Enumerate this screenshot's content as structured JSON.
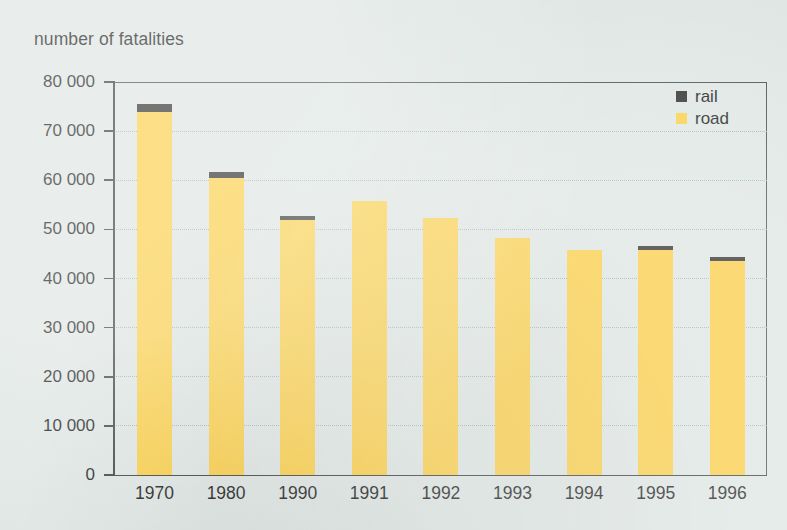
{
  "chart_data": {
    "type": "bar",
    "title": "number of fatalities",
    "subtitle": "",
    "xlabel": "",
    "ylabel": "number of fatalities",
    "stacked": true,
    "grid": true,
    "legend_position": "top-right",
    "categories": [
      "1970",
      "1980",
      "1990",
      "1991",
      "1992",
      "1993",
      "1994",
      "1995",
      "1996"
    ],
    "ylim": [
      0,
      80000
    ],
    "ytick_labels": [
      "80 000",
      "70 000",
      "60 000",
      "50 000",
      "40 000",
      "30 000",
      "20 000",
      "10 000",
      "0"
    ],
    "ytick_values": [
      80000,
      70000,
      60000,
      50000,
      40000,
      30000,
      20000,
      10000,
      0
    ],
    "series": [
      {
        "name": "road",
        "color": "#fbcf47",
        "values": [
          73800,
          60500,
          51900,
          55800,
          52300,
          48200,
          45900,
          45800,
          43600
        ]
      },
      {
        "name": "rail",
        "color": "#2f2f2c",
        "values": [
          1700,
          1100,
          900,
          0,
          0,
          0,
          0,
          800,
          700
        ]
      }
    ],
    "totals": [
      75500,
      61600,
      52800,
      55800,
      52300,
      48200,
      45900,
      46600,
      44300
    ]
  },
  "legend": {
    "entries": [
      {
        "label": "rail",
        "color": "#2f2f2c"
      },
      {
        "label": "road",
        "color": "#fbcf47"
      }
    ]
  },
  "colors": {
    "background": "#dee6e3",
    "axis": "#3a3f42",
    "grid": "#9fb0ad",
    "road": "#fbcf47",
    "rail": "#2f2f2c",
    "text": "#1d1d1d"
  }
}
